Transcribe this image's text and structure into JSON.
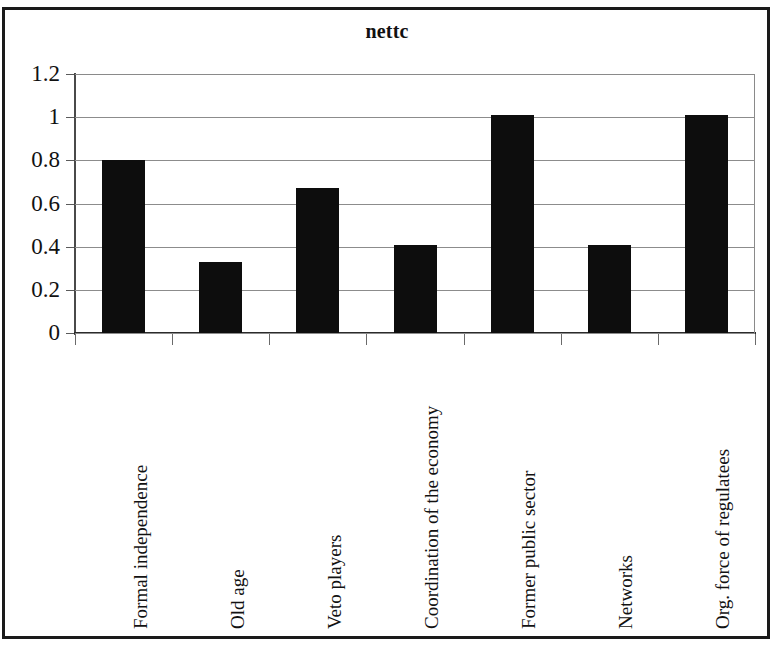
{
  "chart_data": {
    "type": "bar",
    "title": "nettc",
    "xlabel": "",
    "ylabel": "",
    "categories": [
      "Formal independence",
      "Old age",
      "Veto players",
      "Coordination of the economy",
      "Former public sector",
      "Networks",
      "Org. force of regulatees"
    ],
    "values": [
      0.8,
      0.33,
      0.67,
      0.41,
      1.01,
      0.41,
      1.01
    ],
    "ylim": [
      0,
      1.2
    ],
    "ytick_labels": [
      "1.2",
      "1",
      "0.8",
      "0.6",
      "0.4",
      "0.2",
      "0"
    ],
    "ytick_values": [
      1.2,
      1,
      0.8,
      0.6,
      0.4,
      0.2,
      0
    ],
    "grid": true,
    "legend": false,
    "bar_color": "#0d0d0d",
    "gridline_color": "#8c8c8c",
    "axis_color": "#2b2b2b",
    "background": "#ffffff"
  }
}
